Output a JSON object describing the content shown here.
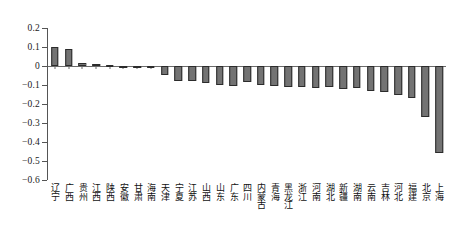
{
  "chart_data": {
    "type": "bar",
    "title": "",
    "subtitle": "",
    "xlabel": "",
    "ylabel": "",
    "ylim": [
      -0.6,
      0.2
    ],
    "grid": false,
    "legend": null,
    "y_ticks": [
      0.2,
      0.1,
      0,
      -0.1,
      -0.2,
      -0.3,
      -0.4,
      -0.5,
      -0.6
    ],
    "y_tick_labels": [
      "0.2",
      "0.1",
      "0",
      "−0.1",
      "−0.2",
      "−0.3",
      "−0.4",
      "−0.5",
      "−0.6"
    ],
    "categories": [
      "辽宁",
      "广西",
      "贵州",
      "江西",
      "陕西",
      "安徽",
      "甘肃",
      "海南",
      "天津",
      "宁夏",
      "江苏",
      "山西",
      "山东",
      "广东",
      "四川",
      "内蒙古",
      "青海",
      "黑龙江",
      "浙江",
      "河南",
      "湖北",
      "新疆",
      "湖南",
      "云南",
      "吉林",
      "河北",
      "福建",
      "北京",
      "上海"
    ],
    "values": [
      0.1,
      0.09,
      0.014,
      0.012,
      0.006,
      0.002,
      -0.008,
      -0.01,
      -0.045,
      -0.08,
      -0.078,
      -0.09,
      -0.098,
      -0.105,
      -0.085,
      -0.098,
      -0.105,
      -0.112,
      -0.108,
      -0.115,
      -0.11,
      -0.122,
      -0.118,
      -0.13,
      -0.138,
      -0.15,
      -0.17,
      -0.27,
      -0.46
    ],
    "colors": {
      "bar_fill": "#737373",
      "bar_edge": "#2b2b2b",
      "axis": "#555555",
      "zero_line": "#6b6b6b",
      "text": "#111111",
      "background": "#ffffff"
    }
  }
}
